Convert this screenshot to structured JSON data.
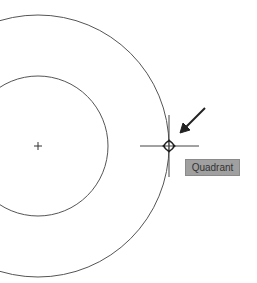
{
  "drawing": {
    "center_marker": {
      "x": 38,
      "y": 146
    },
    "inner_circle": {
      "cx": 38,
      "cy": 146,
      "r": 70
    },
    "outer_circle": {
      "cx": 38,
      "cy": 146,
      "r": 131
    },
    "snap_point": {
      "x": 169,
      "y": 146
    },
    "line_color": "#555555"
  },
  "snap_tooltip": {
    "label": "Quadrant",
    "background": "#a0a0a0"
  }
}
